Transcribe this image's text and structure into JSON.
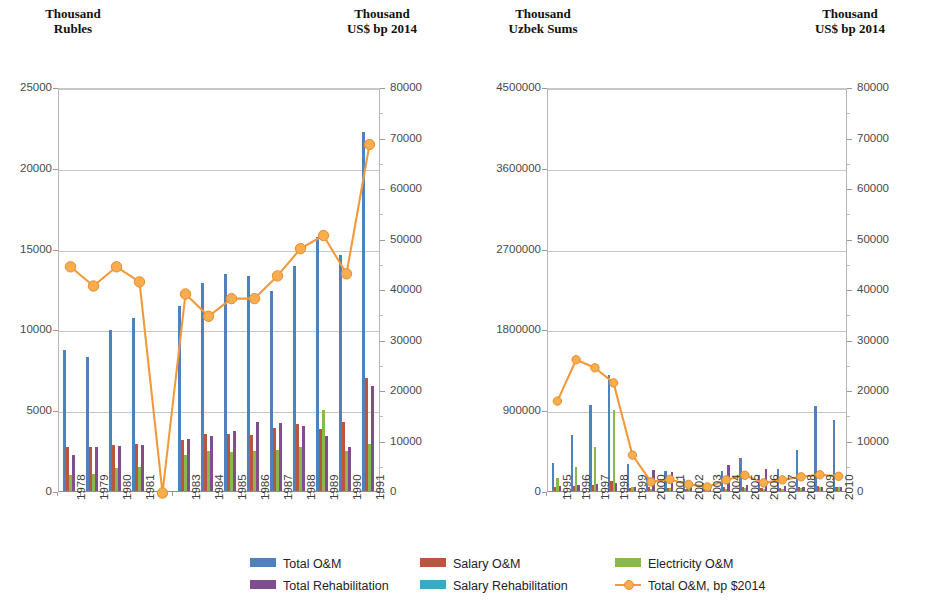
{
  "colors": {
    "total_om": "#4f81bd",
    "salary_om": "#b9563f",
    "electricity_om": "#8bb84b",
    "total_rehab": "#7e4f8e",
    "salary_rehab": "#3ba9c6",
    "line_2014": "#f2993c",
    "gridline": "#c6c6c6",
    "axis_text": "#4a4a4a"
  },
  "axis_titles": {
    "left_panel_left": "Thousand\nRubles",
    "left_panel_right": "Thousand\nUS$ bp 2014",
    "right_panel_left": "Thousand\nUzbek Sums",
    "right_panel_right": "Thousand\nUS$ bp 2014"
  },
  "legend": {
    "items": [
      {
        "key": "total_om",
        "label": "Total O&M",
        "marker": "square",
        "color": "#4f81bd"
      },
      {
        "key": "salary_om",
        "label": "Salary O&M",
        "marker": "square",
        "color": "#b9563f"
      },
      {
        "key": "electricity_om",
        "label": "Electricity O&M",
        "marker": "square",
        "color": "#8bb84b"
      },
      {
        "key": "total_rehab",
        "label": "Total Rehabilitation",
        "marker": "square",
        "color": "#7e4f8e"
      },
      {
        "key": "salary_rehab",
        "label": "Salary Rehabilitation",
        "marker": "square",
        "color": "#3ba9c6"
      },
      {
        "key": "line_2014",
        "label": "Total O&M, bp $2014",
        "marker": "line-dot",
        "color": "#f2993c"
      }
    ]
  },
  "chart_data": [
    {
      "id": "left-chart",
      "type": "bar",
      "title": "",
      "xlabel": "",
      "ylabel": "Thousand Rubles",
      "y2label": "Thousand US$ bp 2014",
      "ylim": [
        0,
        25000
      ],
      "yticks": [
        0,
        5000,
        10000,
        15000,
        20000,
        25000
      ],
      "ytick_labels": [
        "0",
        "5000",
        "10000",
        "15000",
        "20000",
        "25000"
      ],
      "y2lim": [
        0,
        80000
      ],
      "y2ticks": [
        0,
        10000,
        20000,
        30000,
        40000,
        50000,
        60000,
        70000,
        80000
      ],
      "y2tick_labels": [
        "0",
        "10000",
        "20000",
        "30000",
        "40000",
        "50000",
        "60000",
        "70000",
        "80000"
      ],
      "grid": true,
      "legend_position": "bottom",
      "categories": [
        "1978",
        "1979",
        "1980",
        "1981",
        "",
        "1983",
        "1984",
        "1985",
        "1986",
        "1987",
        "1988",
        "1989",
        "1990",
        "1991"
      ],
      "series": [
        {
          "name": "Total O&M",
          "axis": "left",
          "values": [
            8700,
            8300,
            9950,
            10700,
            null,
            11450,
            12900,
            13400,
            13300,
            12400,
            13900,
            15700,
            14600,
            22200
          ]
        },
        {
          "name": "Salary O&M",
          "axis": "left",
          "values": [
            2750,
            2750,
            2850,
            2900,
            null,
            3150,
            3550,
            3500,
            3450,
            3900,
            4150,
            3850,
            4250,
            7000
          ]
        },
        {
          "name": "Electricity O&M",
          "axis": "left",
          "values": [
            1000,
            1050,
            1400,
            1500,
            null,
            2200,
            2450,
            2400,
            2450,
            2550,
            2700,
            5000,
            2450,
            2900
          ]
        },
        {
          "name": "Total Rehabilitation",
          "axis": "left",
          "values": [
            2250,
            2750,
            2800,
            2850,
            null,
            3200,
            3400,
            3700,
            4250,
            4200,
            4050,
            3400,
            2700,
            6500
          ]
        },
        {
          "name": "Salary Rehabilitation",
          "axis": "left",
          "values": [
            0,
            0,
            0,
            0,
            null,
            0,
            0,
            0,
            0,
            0,
            0,
            0,
            0,
            0
          ]
        },
        {
          "name": "Total O&M, bp $2014",
          "axis": "right",
          "values": [
            44800,
            41000,
            44800,
            41800,
            0,
            39400,
            35000,
            38500,
            38500,
            43000,
            48400,
            51000,
            43400,
            69000
          ]
        }
      ]
    },
    {
      "id": "right-chart",
      "type": "bar",
      "title": "",
      "xlabel": "",
      "ylabel": "Thousand Uzbek Sums",
      "y2label": "Thousand US$ bp 2014",
      "ylim": [
        0,
        4500000
      ],
      "yticks": [
        0,
        900000,
        1800000,
        2700000,
        3600000,
        4500000
      ],
      "ytick_labels": [
        "0",
        "900000",
        "1800000",
        "2700000",
        "3600000",
        "4500000"
      ],
      "y2lim": [
        0,
        80000
      ],
      "y2ticks": [
        0,
        10000,
        20000,
        30000,
        40000,
        50000,
        60000,
        70000,
        80000
      ],
      "y2tick_labels": [
        "0",
        "10000",
        "20000",
        "30000",
        "40000",
        "50000",
        "60000",
        "70000",
        "80000"
      ],
      "grid": true,
      "legend_position": "bottom",
      "categories": [
        "1995",
        "1996",
        "1997",
        "1998",
        "1999",
        "2000",
        "2001",
        "2002",
        "2003",
        "2004",
        "2005",
        "2006",
        "2007",
        "2008",
        "2009",
        "2010"
      ],
      "series": [
        {
          "name": "Total O&M",
          "axis": "left",
          "values": [
            310000,
            620000,
            960000,
            1290000,
            300000,
            170000,
            225000,
            130000,
            90000,
            225000,
            370000,
            175000,
            245000,
            455000,
            950000,
            790000
          ]
        },
        {
          "name": "Salary O&M",
          "axis": "left",
          "values": [
            40000,
            60000,
            70000,
            110000,
            35000,
            40000,
            35000,
            25000,
            30000,
            40000,
            45000,
            30000,
            35000,
            45000,
            55000,
            45000
          ]
        },
        {
          "name": "Electricity O&M",
          "axis": "left",
          "values": [
            150000,
            265000,
            490000,
            900000,
            40000,
            25000,
            30000,
            20000,
            15000,
            25000,
            30000,
            20000,
            25000,
            35000,
            45000,
            40000
          ]
        },
        {
          "name": "Total Rehabilitation",
          "axis": "left",
          "values": [
            60000,
            70000,
            80000,
            90000,
            45000,
            230000,
            215000,
            55000,
            40000,
            290000,
            70000,
            245000,
            60000,
            50000,
            45000,
            50000
          ]
        },
        {
          "name": "Salary Rehabilitation",
          "axis": "left",
          "values": [
            0,
            0,
            0,
            0,
            0,
            0,
            0,
            0,
            0,
            0,
            0,
            0,
            0,
            0,
            0,
            0
          ]
        },
        {
          "name": "Total O&M, bp $2014",
          "axis": "right",
          "values": [
            18200,
            26400,
            24800,
            21800,
            7500,
            2200,
            2700,
            1700,
            1200,
            2600,
            3500,
            2000,
            2600,
            3200,
            3600,
            3300
          ]
        }
      ]
    }
  ]
}
